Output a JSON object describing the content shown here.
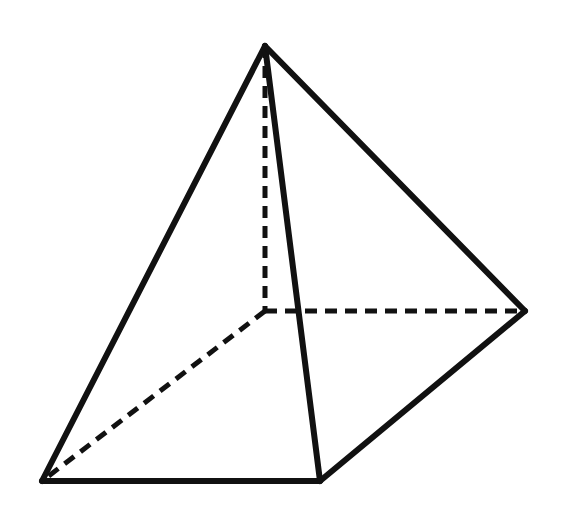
{
  "figure": {
    "background": "#ffffff",
    "stroke_color": "#111111",
    "vertices": {
      "apex": [
        265,
        46
      ],
      "back_left": [
        265,
        311
      ],
      "back_right": [
        525,
        311
      ],
      "front_left": [
        42,
        481
      ],
      "front_right": [
        320,
        481
      ]
    },
    "visible_edges": [
      [
        "apex",
        "front_left"
      ],
      [
        "apex",
        "front_right"
      ],
      [
        "apex",
        "back_right"
      ],
      [
        "front_left",
        "front_right"
      ],
      [
        "front_right",
        "back_right"
      ]
    ],
    "hidden_edges": [
      [
        "apex",
        "back_left"
      ],
      [
        "back_left",
        "back_right"
      ],
      [
        "back_left",
        "front_left"
      ]
    ]
  }
}
